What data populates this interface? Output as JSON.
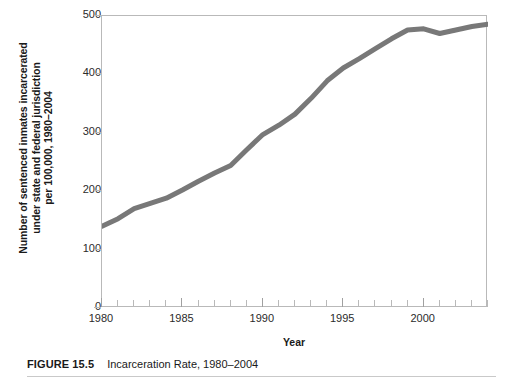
{
  "figure": {
    "caption_number": "FIGURE 15.5",
    "caption_text": "Incarceration Rate, 1980–2004"
  },
  "chart_data": {
    "type": "line",
    "title": "",
    "xlabel": "Year",
    "ylabel": "Number of sentenced inmates incarcerated under state and federal jurisdiction per 100,000, 1980–2004",
    "ylabel_lines": [
      "Number of sentenced inmates incarcerated",
      "under state and federal jurisdiction",
      "per 100,000, 1980–2004"
    ],
    "xlim": [
      1980,
      2004
    ],
    "ylim": [
      0,
      500
    ],
    "xticks": [
      1980,
      1985,
      1990,
      1995,
      2000
    ],
    "xtick_labels": [
      "1980",
      "1985",
      "1990",
      "1995",
      "2000"
    ],
    "xtick_minor_step": 1,
    "yticks": [
      0,
      100,
      200,
      300,
      400,
      500
    ],
    "ytick_labels": [
      "0",
      "100",
      "200",
      "300",
      "400",
      "500"
    ],
    "grid": false,
    "legend": false,
    "series": [
      {
        "name": "Incarceration rate per 100,000",
        "color": "#787878",
        "line_width": 5,
        "x": [
          1980,
          1981,
          1982,
          1983,
          1984,
          1985,
          1986,
          1987,
          1988,
          1989,
          1990,
          1991,
          1992,
          1993,
          1994,
          1995,
          1996,
          1997,
          1998,
          1999,
          2000,
          2001,
          2002,
          2003,
          2004
        ],
        "values": [
          140,
          153,
          170,
          179,
          188,
          202,
          217,
          231,
          244,
          271,
          297,
          313,
          332,
          359,
          389,
          411,
          427,
          444,
          461,
          476,
          478,
          470,
          476,
          482,
          486
        ]
      }
    ]
  }
}
